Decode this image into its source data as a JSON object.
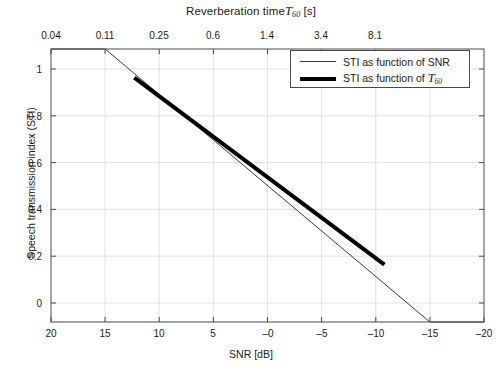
{
  "chart_data": {
    "type": "line",
    "title_main": "Reverberation time",
    "title_symbol": "T",
    "title_subscript": "60",
    "title_unit": "[s]",
    "xlabel": "SNR [dB]",
    "ylabel": "Speech transmission index (STI)",
    "x_axis_bottom": {
      "label": "SNR [dB]",
      "ticks": [
        "20",
        "15",
        "10",
        "5",
        "–0",
        "–5",
        "–10",
        "–15",
        "–20"
      ],
      "values": [
        20,
        15,
        10,
        5,
        0,
        -5,
        -10,
        -15,
        -20
      ],
      "range": [
        20,
        -20
      ],
      "direction": "reversed"
    },
    "x_axis_top": {
      "label": "Reverberation time T60 [s]",
      "ticks": [
        "0.04",
        "0.11",
        "0.25",
        "0.6",
        "1.4",
        "3.4",
        "8.1"
      ],
      "values": [
        0.04,
        0.11,
        0.25,
        0.6,
        1.4,
        3.4,
        8.1
      ],
      "scale": "log"
    },
    "y_axis": {
      "label": "Speech transmission index (STI)",
      "ticks": [
        "0",
        "0.2",
        "0.4",
        "0.6",
        "0.8",
        "1"
      ],
      "values": [
        0,
        0.2,
        0.4,
        0.6,
        0.8,
        1
      ],
      "range": [
        0,
        1
      ]
    },
    "grid": true,
    "legend_position": "top-right",
    "series": [
      {
        "name": "STI as function of  SNR",
        "style": "thin",
        "color": "#3a3a3a",
        "width": 1,
        "points": [
          {
            "snr": 20,
            "sti": 1.0
          },
          {
            "snr": 15,
            "sti": 1.0
          },
          {
            "snr": -15,
            "sti": 0.0
          },
          {
            "snr": -20,
            "sti": 0.0
          }
        ]
      },
      {
        "name": "STI as function of T60",
        "name_main": "STI as function of ",
        "name_symbol": "T",
        "name_subscript": "60",
        "style": "thick",
        "color": "#000000",
        "width": 4,
        "points": [
          {
            "snr": 12.3,
            "sti": 0.895
          },
          {
            "snr": -10.8,
            "sti": 0.21
          }
        ]
      }
    ]
  },
  "legend": {
    "items": [
      {
        "label": "STI as function of  SNR",
        "style": "thin"
      },
      {
        "label_main": "STI as function of ",
        "label_symbol": "T",
        "label_sub": "60",
        "style": "thick"
      }
    ]
  },
  "frame": {
    "left": 51,
    "right": 484,
    "top": 49,
    "bottom": 322
  }
}
